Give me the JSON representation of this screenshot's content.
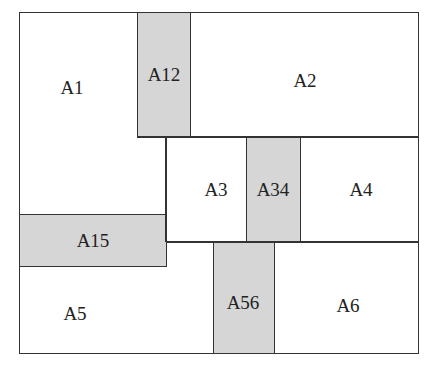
{
  "diagram": {
    "colors": {
      "line": "#333333",
      "shaded": "#d6d6d6",
      "background": "#ffffff"
    },
    "regions": {
      "A1": {
        "label": "A1",
        "shaded": false
      },
      "A12": {
        "label": "A12",
        "shaded": true
      },
      "A2": {
        "label": "A2",
        "shaded": false
      },
      "A3": {
        "label": "A3",
        "shaded": false
      },
      "A34": {
        "label": "A34",
        "shaded": true
      },
      "A4": {
        "label": "A4",
        "shaded": false
      },
      "A15": {
        "label": "A15",
        "shaded": true
      },
      "A5": {
        "label": "A5",
        "shaded": false
      },
      "A56": {
        "label": "A56",
        "shaded": true
      },
      "A6": {
        "label": "A6",
        "shaded": false
      }
    }
  }
}
